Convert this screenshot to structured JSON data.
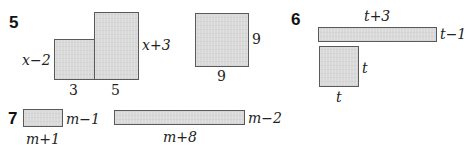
{
  "problems": [
    {
      "number": "5",
      "figures": [
        {
          "shape": "rectangle",
          "labels": {
            "left": "x−2",
            "bottom": "3"
          }
        },
        {
          "shape": "rectangle",
          "labels": {
            "right": "x+3",
            "bottom": "5"
          }
        },
        {
          "shape": "square",
          "labels": {
            "right": "9",
            "bottom": "9"
          }
        }
      ]
    },
    {
      "number": "6",
      "figures": [
        {
          "shape": "rectangle",
          "labels": {
            "top": "t+3",
            "right": "t−1"
          }
        },
        {
          "shape": "square",
          "labels": {
            "right": "t",
            "bottom": "t"
          }
        }
      ]
    },
    {
      "number": "7",
      "figures": [
        {
          "shape": "rectangle",
          "labels": {
            "right": "m−1",
            "bottom": "m+1"
          }
        },
        {
          "shape": "rectangle",
          "labels": {
            "right": "m−2",
            "bottom": "m+8"
          }
        }
      ]
    }
  ],
  "colors": {
    "fill": "#d9d9d9",
    "border": "#5a5a5a",
    "text": "#222222"
  }
}
